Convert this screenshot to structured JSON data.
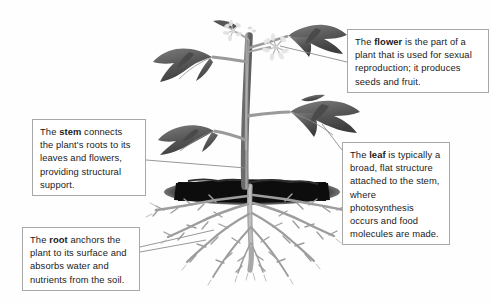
{
  "diagram": {
    "background_color": "#fefefe",
    "box_border_color": "#a8a8a8",
    "leader_line_color": "#8c8c8c",
    "soil_color": "#141414",
    "plant_color": "#6e6e6e"
  },
  "callouts": {
    "flower": {
      "term": "flower",
      "before": "The ",
      "after": " is the part of a plant that is used for sexual reproduction; it produces seeds and fruit."
    },
    "stem": {
      "term": "stem",
      "before": "The ",
      "after": " connects the plant's roots to its leaves and flowers, providing structural support."
    },
    "leaf": {
      "term": "leaf",
      "before": "The ",
      "after": " is typically a broad, flat structure attached to the stem, where photosynthesis occurs and food molecules are made."
    },
    "root": {
      "term": "root",
      "before": "The ",
      "after": " anchors the plant to its surface and absorbs water and nutrients from the soil."
    }
  },
  "parts": {
    "flower_label": "flower-cluster",
    "stem_label": "plant-stem",
    "leaf_label": "plant-leaf",
    "root_label": "root-system",
    "soil_label": "soil-band"
  }
}
